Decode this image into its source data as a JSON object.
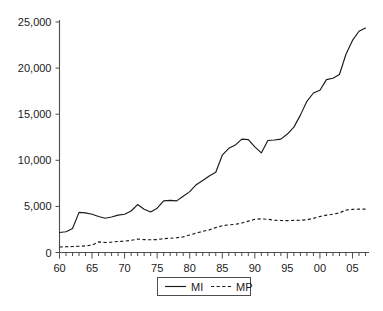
{
  "chart_data": {
    "type": "line",
    "title": "",
    "subtitle": "",
    "xlabel": "",
    "ylabel": "",
    "xlim": [
      1960,
      2007
    ],
    "ylim": [
      0,
      25000
    ],
    "grid": false,
    "legend_position": "bottom-center",
    "x": [
      1960,
      1961,
      1962,
      1963,
      1964,
      1965,
      1966,
      1967,
      1968,
      1969,
      1970,
      1971,
      1972,
      1973,
      1974,
      1975,
      1976,
      1977,
      1978,
      1979,
      1980,
      1981,
      1982,
      1983,
      1984,
      1985,
      1986,
      1987,
      1988,
      1989,
      1990,
      1991,
      1992,
      1993,
      1994,
      1995,
      1996,
      1997,
      1998,
      1999,
      2000,
      2001,
      2002,
      2003,
      2004,
      2005,
      2006,
      2007
    ],
    "x_tick_labels": [
      "60",
      "65",
      "70",
      "75",
      "80",
      "85",
      "90",
      "95",
      "00",
      "05"
    ],
    "x_tick_values": [
      1960,
      1965,
      1970,
      1975,
      1980,
      1985,
      1990,
      1995,
      2000,
      2005
    ],
    "x_minor_tick_interval": 1,
    "y_tick_labels": [
      "0",
      "5,000",
      "10,000",
      "15,000",
      "20,000",
      "25,000"
    ],
    "y_tick_values": [
      0,
      5000,
      10000,
      15000,
      20000,
      25000
    ],
    "series": [
      {
        "name": "MI",
        "style": "solid",
        "color": "#1a1a1a",
        "values": [
          2170,
          2250,
          2600,
          4350,
          4300,
          4150,
          3900,
          3720,
          3850,
          4050,
          4150,
          4500,
          5200,
          4700,
          4400,
          4800,
          5600,
          5650,
          5600,
          6100,
          6600,
          7350,
          7800,
          8300,
          8700,
          10550,
          11300,
          11650,
          12300,
          12250,
          11450,
          10800,
          12150,
          12200,
          12300,
          12850,
          13600,
          14900,
          16400,
          17300,
          17600,
          18750,
          18900,
          19300,
          21500,
          23000,
          24000,
          24350
        ]
      },
      {
        "name": "MP",
        "style": "dashed",
        "color": "#1a1a1a",
        "values": [
          600,
          620,
          650,
          680,
          720,
          800,
          1150,
          1080,
          1130,
          1200,
          1230,
          1320,
          1450,
          1400,
          1380,
          1400,
          1500,
          1550,
          1600,
          1700,
          1900,
          2100,
          2300,
          2450,
          2700,
          2900,
          3000,
          3050,
          3200,
          3400,
          3600,
          3650,
          3600,
          3500,
          3470,
          3450,
          3480,
          3500,
          3550,
          3700,
          3900,
          4050,
          4150,
          4300,
          4600,
          4680,
          4700,
          4700
        ]
      }
    ],
    "legend": [
      {
        "label": "MI",
        "style": "solid"
      },
      {
        "label": "MP",
        "style": "dashed"
      }
    ]
  }
}
